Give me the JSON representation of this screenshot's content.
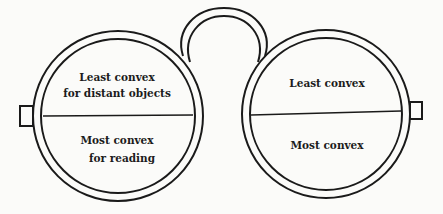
{
  "diagram": {
    "left_lens": {
      "upper_label_lines": [
        "Least convex",
        "for distant objects"
      ],
      "lower_label_lines": [
        "Most convex",
        "for reading"
      ]
    },
    "right_lens": {
      "upper_label_lines": [
        "Least convex"
      ],
      "lower_label_lines": [
        "Most convex"
      ]
    },
    "colors": {
      "ink": "#1a1a1a",
      "paper": "#fbfbf9"
    }
  }
}
